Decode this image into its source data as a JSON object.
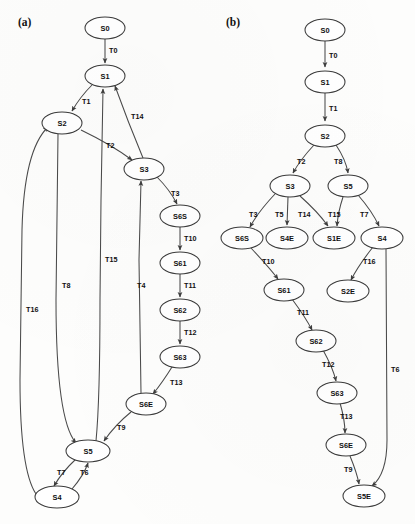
{
  "figure": {
    "panels": [
      {
        "key": "a",
        "label": "(a)",
        "label_x": 18,
        "label_y": 26,
        "nodes": [
          {
            "id": "a-S0",
            "label": "S0",
            "x": 105,
            "y": 28,
            "rx": 20,
            "ry": 11
          },
          {
            "id": "a-S1",
            "label": "S1",
            "x": 105,
            "y": 76,
            "rx": 20,
            "ry": 11
          },
          {
            "id": "a-S2",
            "label": "S2",
            "x": 62,
            "y": 123,
            "rx": 20,
            "ry": 11
          },
          {
            "id": "a-S3",
            "label": "S3",
            "x": 144,
            "y": 169,
            "rx": 20,
            "ry": 11
          },
          {
            "id": "a-S6S",
            "label": "S6S",
            "x": 180,
            "y": 216,
            "rx": 20,
            "ry": 11
          },
          {
            "id": "a-S61",
            "label": "S61",
            "x": 180,
            "y": 263,
            "rx": 20,
            "ry": 11
          },
          {
            "id": "a-S62",
            "label": "S62",
            "x": 180,
            "y": 310,
            "rx": 20,
            "ry": 11
          },
          {
            "id": "a-S63",
            "label": "S63",
            "x": 180,
            "y": 357,
            "rx": 20,
            "ry": 11
          },
          {
            "id": "a-S6E",
            "label": "S6E",
            "x": 146,
            "y": 404,
            "rx": 20,
            "ry": 11
          },
          {
            "id": "a-S5",
            "label": "S5",
            "x": 88,
            "y": 451,
            "rx": 22,
            "ry": 11
          },
          {
            "id": "a-S4",
            "label": "S4",
            "x": 57,
            "y": 497,
            "rx": 22,
            "ry": 11
          }
        ],
        "edges": [
          {
            "id": "a-T0",
            "label": "T0",
            "from": "S0",
            "to": "S1",
            "label_x": 109,
            "label_y": 53
          },
          {
            "id": "a-T1",
            "label": "T1",
            "from": "S1",
            "to": "S2",
            "label_x": 82,
            "label_y": 104
          },
          {
            "id": "a-T2",
            "label": "T2",
            "from": "S2",
            "to": "S3",
            "label_x": 106,
            "label_y": 148
          },
          {
            "id": "a-T14",
            "label": "T14",
            "from": "S3",
            "to": "S1",
            "label_x": 131,
            "label_y": 119
          },
          {
            "id": "a-T3",
            "label": "T3",
            "from": "S3",
            "to": "S6S",
            "label_x": 171,
            "label_y": 196
          },
          {
            "id": "a-T10",
            "label": "T10",
            "from": "S6S",
            "to": "S61",
            "label_x": 184,
            "label_y": 241
          },
          {
            "id": "a-T11",
            "label": "T11",
            "from": "S61",
            "to": "S62",
            "label_x": 184,
            "label_y": 288
          },
          {
            "id": "a-T12",
            "label": "T12",
            "from": "S62",
            "to": "S63",
            "label_x": 184,
            "label_y": 335
          },
          {
            "id": "a-T13",
            "label": "T13",
            "from": "S63",
            "to": "S6E",
            "label_x": 170,
            "label_y": 385
          },
          {
            "id": "a-T9",
            "label": "T9",
            "from": "S6E",
            "to": "S5",
            "label_x": 117,
            "label_y": 430
          },
          {
            "id": "a-T4",
            "label": "T4",
            "from": "S6E",
            "to": "S3",
            "label_x": 137,
            "label_y": 288
          },
          {
            "id": "a-T15",
            "label": "T15",
            "from": "S5",
            "to": "S1",
            "label_x": 105,
            "label_y": 262
          },
          {
            "id": "a-T8",
            "label": "T8",
            "from": "S2",
            "to": "S5",
            "label_x": 62,
            "label_y": 288
          },
          {
            "id": "a-T16",
            "label": "T16",
            "from": "S4",
            "to": "S2",
            "label_x": 26,
            "label_y": 312
          },
          {
            "id": "a-T7",
            "label": "T7",
            "from": "S5",
            "to": "S4",
            "label_x": 63,
            "label_y": 475
          },
          {
            "id": "a-T6",
            "label": "T6",
            "from": "S4",
            "to": "S5",
            "label_x": 84,
            "label_y": 475
          }
        ]
      },
      {
        "key": "b",
        "label": "(b)",
        "label_x": 226,
        "label_y": 26,
        "nodes": [
          {
            "id": "b-S0",
            "label": "S0",
            "x": 325,
            "y": 30,
            "rx": 20,
            "ry": 11
          },
          {
            "id": "b-S1",
            "label": "S1",
            "x": 325,
            "y": 82,
            "rx": 20,
            "ry": 11
          },
          {
            "id": "b-S2",
            "label": "S2",
            "x": 325,
            "y": 136,
            "rx": 20,
            "ry": 11
          },
          {
            "id": "b-S3",
            "label": "S3",
            "x": 290,
            "y": 186,
            "rx": 20,
            "ry": 11
          },
          {
            "id": "b-S5",
            "label": "S5",
            "x": 348,
            "y": 186,
            "rx": 20,
            "ry": 11
          },
          {
            "id": "b-S6S",
            "label": "S6S",
            "x": 242,
            "y": 238,
            "rx": 21,
            "ry": 11
          },
          {
            "id": "b-S4E",
            "label": "S4E",
            "x": 287,
            "y": 238,
            "rx": 21,
            "ry": 11
          },
          {
            "id": "b-S1E",
            "label": "S1E",
            "x": 334,
            "y": 238,
            "rx": 21,
            "ry": 11
          },
          {
            "id": "b-S4",
            "label": "S4",
            "x": 382,
            "y": 238,
            "rx": 21,
            "ry": 11
          },
          {
            "id": "b-S61",
            "label": "S61",
            "x": 284,
            "y": 290,
            "rx": 20,
            "ry": 11
          },
          {
            "id": "b-S2E",
            "label": "S2E",
            "x": 348,
            "y": 291,
            "rx": 21,
            "ry": 11
          },
          {
            "id": "b-S62",
            "label": "S62",
            "x": 316,
            "y": 341,
            "rx": 20,
            "ry": 11
          },
          {
            "id": "b-S63",
            "label": "S63",
            "x": 337,
            "y": 393,
            "rx": 20,
            "ry": 11
          },
          {
            "id": "b-S6E",
            "label": "S6E",
            "x": 346,
            "y": 445,
            "rx": 20,
            "ry": 11
          },
          {
            "id": "b-S5E",
            "label": "S5E",
            "x": 364,
            "y": 496,
            "rx": 21,
            "ry": 11
          }
        ],
        "edges": [
          {
            "id": "b-T0",
            "label": "T0",
            "from": "S0",
            "to": "S1",
            "label_x": 329,
            "label_y": 58
          },
          {
            "id": "b-T1",
            "label": "T1",
            "from": "S1",
            "to": "S2",
            "label_x": 329,
            "label_y": 111
          },
          {
            "id": "b-T2",
            "label": "T2",
            "from": "S2",
            "to": "S3",
            "label_x": 301,
            "label_y": 164
          },
          {
            "id": "b-T8",
            "label": "T8",
            "from": "S2",
            "to": "S5",
            "label_x": 337,
            "label_y": 164
          },
          {
            "id": "b-T3",
            "label": "T3",
            "from": "S3",
            "to": "S6S",
            "label_x": 255,
            "label_y": 217
          },
          {
            "id": "b-T5",
            "label": "T5",
            "from": "S3",
            "to": "S4E",
            "label_x": 283,
            "label_y": 217
          },
          {
            "id": "b-T14",
            "label": "T14",
            "from": "S3",
            "to": "S1E",
            "label_x": 306,
            "label_y": 217
          },
          {
            "id": "b-T15",
            "label": "T15",
            "from": "S5",
            "to": "S1E",
            "label_x": 336,
            "label_y": 217
          },
          {
            "id": "b-T7",
            "label": "T7",
            "from": "S5",
            "to": "S4",
            "label_x": 364,
            "label_y": 217
          },
          {
            "id": "b-T10",
            "label": "T10",
            "from": "S6S",
            "to": "S61",
            "label_x": 268,
            "label_y": 264
          },
          {
            "id": "b-T16",
            "label": "T16",
            "from": "S4",
            "to": "S2E",
            "label_x": 369,
            "label_y": 264
          },
          {
            "id": "b-T11",
            "label": "T11",
            "from": "S61",
            "to": "S62",
            "label_x": 304,
            "label_y": 315
          },
          {
            "id": "b-T12",
            "label": "T12",
            "from": "S62",
            "to": "S63",
            "label_x": 328,
            "label_y": 367
          },
          {
            "id": "b-T13",
            "label": "T13",
            "from": "S63",
            "to": "S6E",
            "label_x": 345,
            "label_y": 419
          },
          {
            "id": "b-T9",
            "label": "T9",
            "from": "S6E",
            "to": "S5E",
            "label_x": 348,
            "label_y": 472
          },
          {
            "id": "b-T6",
            "label": "T6",
            "from": "S4",
            "to": "S5E",
            "label_x": 392,
            "label_y": 372
          }
        ]
      }
    ]
  },
  "colors": {
    "node_stroke": "#3b3b3b",
    "edge_stroke": "#4a4a4a",
    "text": "#101010",
    "background": "#fdfdfc"
  }
}
